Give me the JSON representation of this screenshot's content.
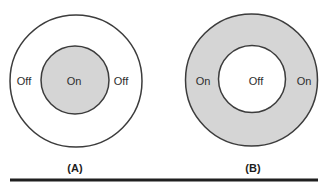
{
  "figure": {
    "diagram_a": {
      "caption": "(A)",
      "outer_left_label": "Off",
      "inner_label": "On",
      "outer_right_label": "Off"
    },
    "diagram_b": {
      "ring_left_label": "On",
      "inner_label": "Off",
      "ring_right_label": "On",
      "caption": "(B)"
    },
    "colors": {
      "shaded_fill": "#d5d5d5",
      "unshaded_fill": "#ffffff",
      "stroke": "#3c3c3c",
      "text": "#2e2e2e",
      "rule": "#1f1f1f",
      "background": "#ffffff"
    }
  }
}
